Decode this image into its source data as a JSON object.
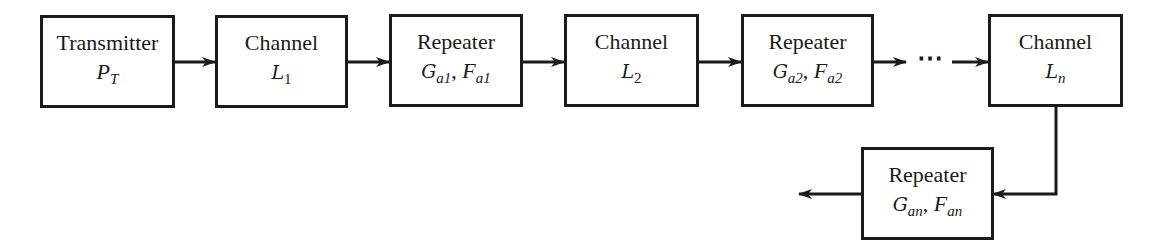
{
  "diagram": {
    "blocks": [
      {
        "id": "transmitter",
        "label": "Transmitter",
        "param_symbol": "P",
        "param_sub": "T",
        "param_text": "P_T"
      },
      {
        "id": "channel-1",
        "label": "Channel",
        "param_symbol": "L",
        "param_sub": "1",
        "param_text": "L_1"
      },
      {
        "id": "repeater-1",
        "label": "Repeater",
        "gain_symbol": "G",
        "gain_sub": "a1",
        "nf_symbol": "F",
        "nf_sub": "a1",
        "param_text": "G_a1, F_a1"
      },
      {
        "id": "channel-2",
        "label": "Channel",
        "param_symbol": "L",
        "param_sub": "2",
        "param_text": "L_2"
      },
      {
        "id": "repeater-2",
        "label": "Repeater",
        "gain_symbol": "G",
        "gain_sub": "a2",
        "nf_symbol": "F",
        "nf_sub": "a2",
        "param_text": "G_a2, F_a2"
      },
      {
        "id": "channel-n",
        "label": "Channel",
        "param_symbol": "L",
        "param_sub": "n",
        "param_text": "L_n"
      },
      {
        "id": "repeater-n",
        "label": "Repeater",
        "gain_symbol": "G",
        "gain_sub": "an",
        "nf_symbol": "F",
        "nf_sub": "an",
        "param_text": "G_an, F_an"
      }
    ],
    "ellipsis": "⋯",
    "separator": ", ",
    "connections": [
      {
        "from": "transmitter",
        "to": "channel-1"
      },
      {
        "from": "channel-1",
        "to": "repeater-1"
      },
      {
        "from": "repeater-1",
        "to": "channel-2"
      },
      {
        "from": "channel-2",
        "to": "repeater-2"
      },
      {
        "from": "repeater-2",
        "to": "ellipsis"
      },
      {
        "from": "ellipsis",
        "to": "channel-n"
      },
      {
        "from": "channel-n",
        "to": "repeater-n"
      },
      {
        "from": "repeater-n",
        "to": "output"
      }
    ],
    "colors": {
      "stroke": "#1a1a1a",
      "background": "#ffffff"
    }
  }
}
